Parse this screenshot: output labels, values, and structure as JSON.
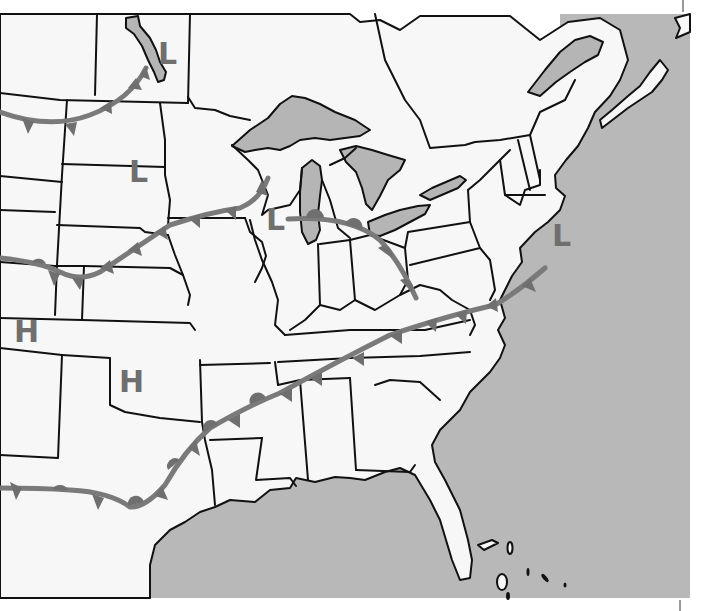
{
  "map": {
    "title": "Weather map of the central and eastern United States",
    "colors": {
      "land": "#f7f7f7",
      "water": "#b8b8b8",
      "border": "#111111",
      "front": "#7a7a7a",
      "front_symbol": "#6f6f6f",
      "pressure_label": "#6f6f6f"
    },
    "pressure_systems": [
      {
        "type": "low",
        "label": "L",
        "location": "Manitoba / Lake Winnipeg",
        "x": 165,
        "y": 53
      },
      {
        "type": "low",
        "label": "L",
        "location": "North Dakota",
        "x": 140,
        "y": 170
      },
      {
        "type": "low",
        "label": "L",
        "location": "Wisconsin / Lake Michigan",
        "x": 276,
        "y": 222
      },
      {
        "type": "low",
        "label": "L",
        "location": "Atlantic off New Jersey",
        "x": 562,
        "y": 238
      },
      {
        "type": "high",
        "label": "H",
        "location": "Colorado",
        "x": 27,
        "y": 331
      },
      {
        "type": "high",
        "label": "H",
        "location": "Oklahoma",
        "x": 131,
        "y": 382
      }
    ],
    "fronts": [
      {
        "type": "cold",
        "name": "northern-cold-front",
        "description": "Montana to Manitoba",
        "triangles": 5
      },
      {
        "type": "stationary",
        "name": "central-stationary-front",
        "description": "Colorado through Nebraska to Wisconsin",
        "triangles": 8,
        "semicircles": 1
      },
      {
        "type": "warm",
        "name": "great-lakes-warm-front",
        "description": "Wisconsin low through Ohio to West Virginia",
        "semicircles": 4
      },
      {
        "type": "stationary",
        "name": "southern-stationary-front",
        "description": "New Mexico through Texas, Arkansas, Tennessee to Virginia coast",
        "triangles": 12,
        "semicircles": 6
      }
    ],
    "water_bodies": [
      "Gulf of Mexico",
      "Atlantic Ocean",
      "Lake Superior",
      "Lake Michigan",
      "Lake Huron",
      "Lake Erie",
      "Lake Ontario",
      "Lake Winnipeg",
      "Gulf of St. Lawrence"
    ]
  }
}
